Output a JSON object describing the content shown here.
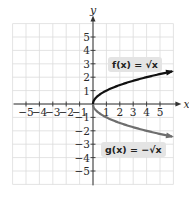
{
  "chart_data": {
    "type": "line",
    "title": "",
    "xlabel": "x",
    "ylabel": "y",
    "xlim": [
      -6,
      6
    ],
    "ylim": [
      -6,
      6
    ],
    "grid": true,
    "x_ticks": [
      -5,
      -4,
      -3,
      -2,
      -1,
      1,
      2,
      3,
      4,
      5
    ],
    "y_ticks": [
      -5,
      -4,
      -3,
      -2,
      -1,
      1,
      2,
      3,
      4,
      5
    ],
    "x_tick_labels": [
      "−5",
      "−4",
      "−3",
      "−2",
      "−1",
      "1",
      "2",
      "3",
      "4",
      "5"
    ],
    "y_tick_labels": [
      "−5",
      "−4",
      "−3",
      "−2",
      "−1",
      "1",
      "2",
      "3",
      "4",
      "5"
    ],
    "series": [
      {
        "name": "f(x) = √x",
        "color": "#111111",
        "x": [
          0,
          0.25,
          1,
          2,
          3,
          4,
          5,
          6
        ],
        "values": [
          0,
          0.5,
          1,
          1.41,
          1.73,
          2,
          2.24,
          2.45
        ]
      },
      {
        "name": "g(x) = −√x",
        "color": "#6e6e6e",
        "x": [
          0,
          0.25,
          1,
          2,
          3,
          4,
          5,
          6
        ],
        "values": [
          0,
          -0.5,
          -1,
          -1.41,
          -1.73,
          -2,
          -2.24,
          -2.45
        ]
      }
    ],
    "annotations": [
      {
        "text": "f(x) = √x",
        "position": "upper right, above f curve"
      },
      {
        "text": "g(x) = −√x",
        "position": "lower right, below g curve"
      }
    ]
  },
  "labels": {
    "f": "f(x) = √x",
    "g": "g(x) = −√x",
    "x_axis": "x",
    "y_axis": "y"
  },
  "colors": {
    "grid": "#dcdcdc",
    "axis": "#333333",
    "f_curve": "#111111",
    "g_curve": "#6e6e6e",
    "label_bg": "#e4e4e4"
  }
}
